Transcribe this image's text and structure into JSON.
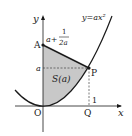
{
  "diagram": {
    "curve_label": "y=ax²",
    "axis_x_label": "x",
    "axis_y_label": "y",
    "origin_label": "O",
    "point_A_label": "A",
    "point_P_label": "P",
    "point_Q_label": "Q",
    "A_value_prefix": "a+",
    "A_value_num": "1",
    "A_value_den": "2a",
    "a_tick_label": "a",
    "one_tick_label": "1",
    "region_label": "S(a)",
    "colors": {
      "shade": "#c8c8c8",
      "line": "#1a1a1a"
    }
  }
}
